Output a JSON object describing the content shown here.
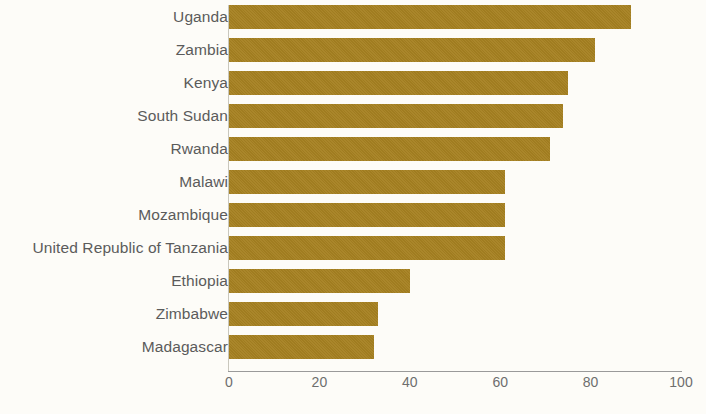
{
  "chart_data": {
    "type": "bar",
    "orientation": "horizontal",
    "title": "",
    "xlabel": "",
    "ylabel": "",
    "xlim": [
      0,
      100
    ],
    "grid": false,
    "legend": null,
    "bar_color": "#a68121",
    "categories": [
      "Uganda",
      "Zambia",
      "Kenya",
      "South Sudan",
      "Rwanda",
      "Malawi",
      "Mozambique",
      "United Republic of Tanzania",
      "Ethiopia",
      "Zimbabwe",
      "Madagascar"
    ],
    "values": [
      89,
      81,
      75,
      74,
      71,
      61,
      61,
      61,
      40,
      33,
      32
    ],
    "xticks": [
      0,
      20,
      40,
      60,
      80,
      100
    ],
    "xtick_labels": [
      "0",
      "20",
      "40",
      "60",
      "80",
      "100"
    ]
  },
  "footnote": {
    "text": ""
  }
}
